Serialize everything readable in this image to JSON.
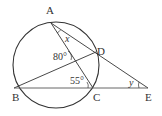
{
  "diagram": {
    "type": "geometry",
    "circle": {
      "cx": 56,
      "cy": 65,
      "r": 43
    },
    "points": {
      "A": {
        "label": "A",
        "x": 51,
        "y": 23
      },
      "B": {
        "label": "B",
        "x": 14,
        "y": 88
      },
      "C": {
        "label": "C",
        "x": 93,
        "y": 88
      },
      "D": {
        "label": "D",
        "x": 96,
        "y": 52
      },
      "E": {
        "label": "E",
        "x": 148,
        "y": 88
      }
    },
    "segments": [
      [
        "A",
        "E"
      ],
      [
        "A",
        "C"
      ],
      [
        "B",
        "D"
      ],
      [
        "B",
        "E"
      ]
    ],
    "angles": {
      "x": {
        "label": "x",
        "at": "A"
      },
      "angle_80": {
        "label": "80°",
        "at": "AC∩BD"
      },
      "angle_55": {
        "label": "55°",
        "at": "C"
      },
      "y": {
        "label": "y",
        "at": "E"
      }
    },
    "colors": {
      "stroke": "#333333",
      "background": "#ffffff"
    }
  }
}
